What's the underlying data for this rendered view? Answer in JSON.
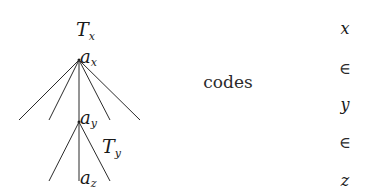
{
  "diagram": {
    "tree": {
      "root_tree_label": {
        "main": "T",
        "sub": "x"
      },
      "root_node": {
        "main": "a",
        "sub": "x"
      },
      "child_node": {
        "main": "a",
        "sub": "y"
      },
      "subtree_label": {
        "main": "T",
        "sub": "y"
      },
      "leaf_node": {
        "main": "a",
        "sub": "z"
      }
    },
    "center_label": "codes",
    "sequence": [
      "x",
      "∈",
      "y",
      "∈",
      "z"
    ],
    "colors": {
      "ink": "#1a1a1a",
      "background": "#ffffff"
    }
  }
}
